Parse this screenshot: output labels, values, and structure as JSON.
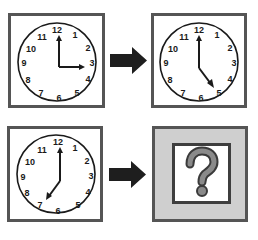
{
  "puzzle": {
    "description": "Clock analogy puzzle: 3:00 → 5:00 as 7:00 → ?",
    "pairs": [
      {
        "left": {
          "hour_hand_target": 3,
          "minute_hand_target": 12,
          "time": "3:00"
        },
        "right": {
          "hour_hand_target": 5,
          "minute_hand_target": 12,
          "time": "5:00"
        }
      },
      {
        "left": {
          "hour_hand_target": 7,
          "minute_hand_target": 12,
          "time": "7:00"
        },
        "right": {
          "unknown": true,
          "symbol": "?"
        }
      }
    ],
    "clock_numbers": [
      "12",
      "1",
      "2",
      "3",
      "4",
      "5",
      "6",
      "7",
      "8",
      "9",
      "10",
      "11"
    ],
    "arrow_icon": "right-arrow",
    "colors": {
      "frame": "#555555",
      "ink": "#1a1a1a",
      "arrow": "#1e1e1e",
      "question_bg": "#cfcfcf",
      "question_mark": "#8a8a8a"
    }
  }
}
